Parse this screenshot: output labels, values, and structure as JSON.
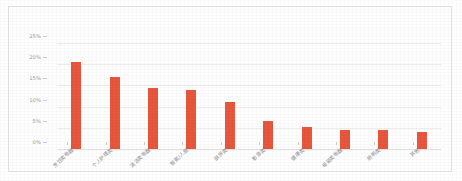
{
  "chart_data": {
    "type": "bar",
    "title": "",
    "xlabel": "",
    "ylabel": "",
    "ylim": [
      0,
      25
    ],
    "ytick_labels": [
      "0%",
      "5%",
      "10%",
      "15%",
      "20%",
      "25%"
    ],
    "ytick_values": [
      0,
      5,
      10,
      15,
      20,
      25
    ],
    "grid": true,
    "legend": "none",
    "bar_color": "#e8563c",
    "categories": [
      "烹饪类电器",
      "个人护理类",
      "清洁类电器",
      "智能/人居",
      "厨房类",
      "影音类",
      "健康类",
      "母婴类电器",
      "照明类",
      "其他"
    ],
    "values": [
      20.5,
      17.0,
      14.5,
      14.0,
      11.2,
      6.5,
      5.2,
      4.6,
      4.4,
      4.0
    ]
  },
  "axis": {
    "unit_suffix": "%"
  }
}
